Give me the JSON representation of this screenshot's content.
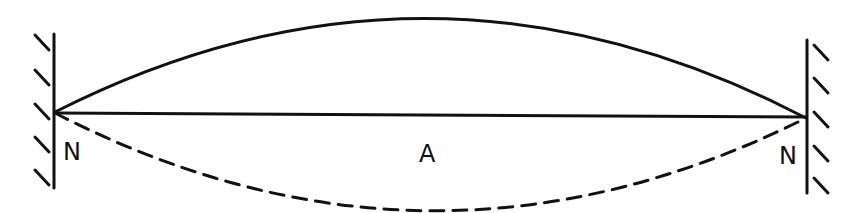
{
  "diagram": {
    "type": "standing-wave",
    "labels": {
      "node_left": "N",
      "antinode": "A",
      "node_right": "N"
    },
    "colors": {
      "stroke": "#111111",
      "background": "#ffffff"
    }
  }
}
